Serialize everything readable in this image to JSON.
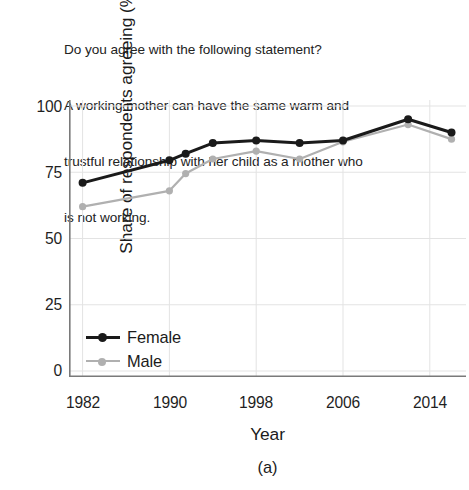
{
  "prompt": {
    "lines": [
      "Do you agree with the following statement?",
      "A working mother can have the same warm and",
      "trustful relationship with her child as a mother who",
      "is not working."
    ]
  },
  "axes": {
    "y_title": "Share of respondents agreeing (%)",
    "x_title": "Year",
    "y_ticks": [
      "0",
      "25",
      "50",
      "75",
      "100"
    ],
    "x_ticks": [
      "1982",
      "1990",
      "1998",
      "2006",
      "2014"
    ]
  },
  "legend": {
    "position": "inside-bottom-left",
    "entries": [
      {
        "label": "Female",
        "color": "#1a1a1a"
      },
      {
        "label": "Male",
        "color": "#b0b0b0"
      }
    ]
  },
  "subcaption": "(a)",
  "colors": {
    "female": "#1a1a1a",
    "male": "#b0b0b0",
    "grid": "#e3e3e3",
    "axis": "#7a7a7a",
    "background": "#ffffff"
  },
  "chart_data": {
    "type": "line",
    "title": "Do you agree with the following statement? A working mother can have the same warm and trustful relationship with her child as a mother who is not working.",
    "xlabel": "Year",
    "ylabel": "Share of respondents agreeing (%)",
    "xlim": [
      1978,
      2018
    ],
    "ylim": [
      0,
      100
    ],
    "xticks": [
      1982,
      1990,
      1998,
      2006,
      2014
    ],
    "yticks": [
      0,
      25,
      50,
      75,
      100
    ],
    "grid": true,
    "legend_position": "lower left (inside axes)",
    "series": [
      {
        "name": "Female",
        "color": "#1a1a1a",
        "marker": "circle-filled",
        "x": [
          1982,
          1990,
          1991.5,
          1994,
          1998,
          2002,
          2006,
          2012,
          2016
        ],
        "values": [
          71,
          79.5,
          82,
          86,
          87,
          86,
          87,
          95,
          90
        ]
      },
      {
        "name": "Male",
        "color": "#b0b0b0",
        "marker": "circle-filled",
        "x": [
          1982,
          1990,
          1991.5,
          1994,
          1998,
          2002,
          2006,
          2012,
          2016
        ],
        "values": [
          62,
          68,
          74.5,
          80,
          83,
          80,
          86.5,
          93,
          87.5
        ]
      }
    ]
  }
}
